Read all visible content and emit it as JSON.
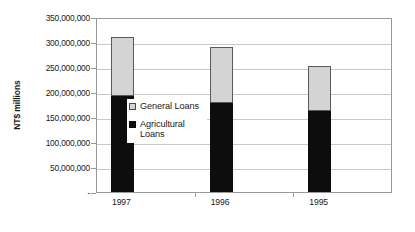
{
  "chart_data": {
    "type": "bar",
    "subtype": "stacked-vertical",
    "title": "",
    "xlabel": "",
    "ylabel": "NT$ millions",
    "categories": [
      "1997",
      "1996",
      "1995"
    ],
    "series": [
      {
        "name": "Agricultural Loans",
        "color": "#0d0d0d",
        "values": [
          193000000,
          178000000,
          162000000
        ]
      },
      {
        "name": "General Loans",
        "color": "#d4d4d4",
        "values": [
          117000000,
          113000000,
          91000000
        ]
      }
    ],
    "totals": [
      310000000,
      291000000,
      253000000
    ],
    "ylim": [
      0,
      350000000
    ],
    "ytick_values": [
      0,
      50000000,
      100000000,
      150000000,
      200000000,
      250000000,
      300000000,
      350000000
    ],
    "ytick_labels": [
      "-",
      "50,000,000",
      "100,000,000",
      "150,000,000",
      "200,000,000",
      "250,000,000",
      "300,000,000",
      "350,000,000"
    ],
    "grid": true,
    "grid_axis": "y",
    "legend_position": "inside-left",
    "legend_entries": [
      "General Loans",
      "Agricultural Loans"
    ],
    "stack_order_bottom_to_top": [
      "Agricultural Loans",
      "General Loans"
    ]
  },
  "axis": {
    "y_title": "NT$ millions"
  },
  "legend": {
    "items": [
      {
        "label": "General Loans",
        "swatch": "light-gray"
      },
      {
        "label": "Agricultural Loans",
        "swatch": "black"
      }
    ]
  },
  "colors": {
    "general_loans": "#d4d4d4",
    "agricultural_loans": "#0d0d0d",
    "gridline": "#c8c8c8",
    "frame": "#9a9a9a",
    "background": "#ffffff"
  }
}
